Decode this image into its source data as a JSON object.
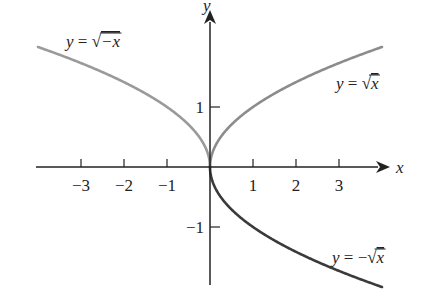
{
  "chart_data": {
    "type": "line",
    "title": "",
    "xlabel": "x",
    "ylabel": "y",
    "xlim": [
      -4,
      4
    ],
    "ylim": [
      -2.1,
      2.4
    ],
    "grid": false,
    "x_ticks": [
      -3,
      -2,
      -1,
      1,
      2,
      3
    ],
    "x_tick_labels": [
      "−3",
      "−2",
      "−1",
      "1",
      "2",
      "3"
    ],
    "y_ticks": [
      1,
      -1
    ],
    "y_tick_labels": [
      "1",
      "−1"
    ],
    "series": [
      {
        "name": "y = √−x",
        "label_parts": {
          "lhs": "y",
          "eq": " = ",
          "radical": "√",
          "radicand": "−x"
        },
        "color": "#9a9a9a",
        "domain": [
          -4,
          0
        ],
        "x": [
          -4,
          -3,
          -2,
          -1,
          -0.5,
          0
        ],
        "y": [
          2,
          1.732,
          1.414,
          1,
          0.707,
          0
        ]
      },
      {
        "name": "y = √x",
        "label_parts": {
          "lhs": "y",
          "eq": " = ",
          "radical": "√",
          "radicand": "x"
        },
        "color": "#8c8c8c",
        "domain": [
          0,
          4
        ],
        "x": [
          0,
          0.5,
          1,
          2,
          3,
          4
        ],
        "y": [
          0,
          0.707,
          1,
          1.414,
          1.732,
          2
        ]
      },
      {
        "name": "y = −√x",
        "label_parts": {
          "lhs": "y",
          "eq": " = −",
          "radical": "√",
          "radicand": "x"
        },
        "color": "#3a3a3a",
        "domain": [
          0,
          4
        ],
        "x": [
          0,
          0.5,
          1,
          2,
          3,
          4
        ],
        "y": [
          0,
          -0.707,
          -1,
          -1.414,
          -1.732,
          -2
        ]
      }
    ],
    "legend": "inline labels near curves"
  },
  "axes": {
    "x_label": "x",
    "y_label": "y"
  }
}
